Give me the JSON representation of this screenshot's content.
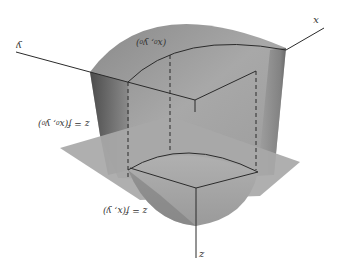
{
  "figure": {
    "orientation": "rotated-180",
    "colors": {
      "background": "#ffffff",
      "surface_light": "#b4b4b4",
      "surface_mid": "#9a9a9a",
      "surface_dark": "#555555",
      "plane": "#a6a6a6",
      "lines": "#2b2b2b"
    }
  },
  "labels": {
    "x_axis": "x",
    "y_axis": "y",
    "z_axis": "z",
    "surface_eq": "z = f(x, y)",
    "plane_eq": "z = f(x₀, y₀)",
    "point": "(x₀, y₀)"
  }
}
